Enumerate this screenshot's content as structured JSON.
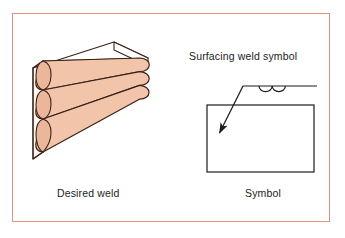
{
  "figure": {
    "kind": "welding-symbol-diagram",
    "background_color": "#ffffff",
    "border_color": "#e0937a"
  },
  "labels": {
    "desired_weld": "Desired weld",
    "symbol": "Symbol",
    "surfacing_weld_symbol": "Surfacing weld symbol"
  },
  "left_panel": {
    "name": "desired-weld-illustration",
    "description": "isometric steel block with three horizontal surfacing weld beads on front face",
    "bead_count": 3,
    "bead_fill_color": "#f2c5ab",
    "outline_color": "#3a2218",
    "top_face_color": "#ffffff",
    "end_face_color": "#fdf6f2"
  },
  "right_panel": {
    "name": "symbol-illustration",
    "workpiece_rect": {
      "x": 207,
      "y": 105,
      "width": 107,
      "height": 67,
      "stroke": "#1c1c1c"
    },
    "reference_line": {
      "x1": 243,
      "y1": 86,
      "x2": 317,
      "y2": 86,
      "stroke": "#1c1c1c"
    },
    "leader_line": {
      "x1": 243,
      "y1": 86,
      "x2": 219,
      "y2": 135,
      "stroke": "#1c1c1c",
      "arrowhead": "filled"
    },
    "weld_symbol": {
      "name": "surfacing-weld-arcs",
      "arc_count": 2,
      "arc_radius": 6.5,
      "arcs_below_reference_line": true
    }
  }
}
